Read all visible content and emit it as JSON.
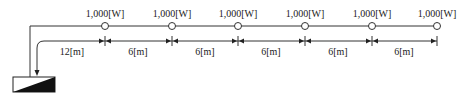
{
  "diagram": {
    "panel": {
      "name": "distribution-panel"
    },
    "loads": [
      {
        "label": "1,000[W]",
        "x": 105
      },
      {
        "label": "1,000[W]",
        "x": 172
      },
      {
        "label": "1,000[W]",
        "x": 238
      },
      {
        "label": "1,000[W]",
        "x": 305
      },
      {
        "label": "1,000[W]",
        "x": 372
      },
      {
        "label": "1,000[W]",
        "x": 437
      }
    ],
    "dimensions": [
      {
        "label": "12[m]",
        "x": 72
      },
      {
        "label": "6[m]",
        "x": 138
      },
      {
        "label": "6[m]",
        "x": 205
      },
      {
        "label": "6[m]",
        "x": 271
      },
      {
        "label": "6[m]",
        "x": 338
      },
      {
        "label": "6[m]",
        "x": 404
      }
    ],
    "colors": {
      "line": "#333333",
      "text": "#222222"
    }
  }
}
